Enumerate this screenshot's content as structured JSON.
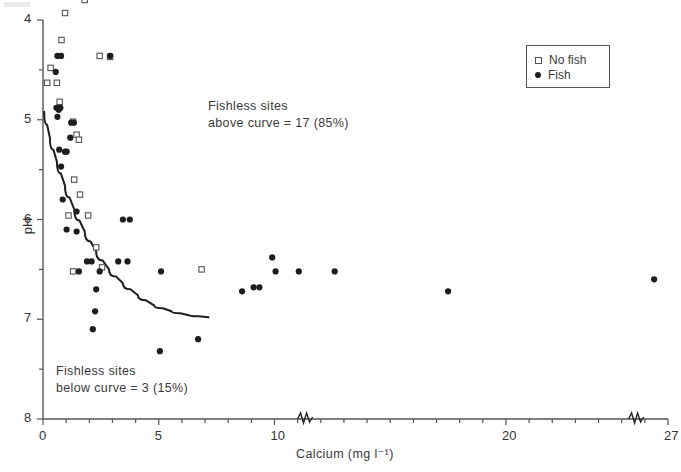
{
  "figure": {
    "ylabel": "pH",
    "xlabel": "Calcium (mg l⁻¹)",
    "annotation_above": "Fishless sites\nabove curve = 17 (85%)",
    "annotation_below": "Fishless sites\nbelow curve = 3 (15%)",
    "legend": {
      "no_fish": "No fish",
      "fish": "Fish"
    }
  },
  "chart_data": {
    "type": "scatter",
    "title": "",
    "xlabel": "Calcium (mg l⁻¹)",
    "ylabel": "pH",
    "xlim": [
      0,
      27
    ],
    "ylim": [
      8,
      4
    ],
    "y_inverted": true,
    "grid": false,
    "legend_position": "top-right",
    "xticks": [
      0,
      5,
      10,
      20,
      27
    ],
    "xtick_labels": [
      "0",
      "5",
      "10",
      "20",
      "27"
    ],
    "xminor_step": 1,
    "yticks": [
      4,
      5,
      6,
      7,
      8
    ],
    "ytick_labels": [
      "4",
      "5",
      "6",
      "7",
      "8"
    ],
    "yminor_step": 0.5,
    "axis_breaks": [
      11.3,
      25.6
    ],
    "series": [
      {
        "name": "No fish",
        "marker": "open-square",
        "color": "#555555",
        "points": [
          [
            1.8,
            3.8
          ],
          [
            0.95,
            3.93
          ],
          [
            0.8,
            4.2
          ],
          [
            2.45,
            4.36
          ],
          [
            0.33,
            4.48
          ],
          [
            0.18,
            4.63
          ],
          [
            0.6,
            4.63
          ],
          [
            2.9,
            4.37
          ],
          [
            0.72,
            4.82
          ],
          [
            1.3,
            5.02
          ],
          [
            1.45,
            5.15
          ],
          [
            1.55,
            5.2
          ],
          [
            1.35,
            5.6
          ],
          [
            1.6,
            5.75
          ],
          [
            1.1,
            5.96
          ],
          [
            1.95,
            5.96
          ],
          [
            2.3,
            6.28
          ],
          [
            2.55,
            6.48
          ],
          [
            1.3,
            6.52
          ],
          [
            6.85,
            6.5
          ]
        ]
      },
      {
        "name": "Fish",
        "marker": "filled-circle",
        "color": "#1d1d1d",
        "points": [
          [
            0.62,
            4.36
          ],
          [
            0.78,
            4.36
          ],
          [
            2.9,
            4.36
          ],
          [
            0.55,
            4.52
          ],
          [
            0.58,
            4.88
          ],
          [
            0.68,
            4.9
          ],
          [
            0.75,
            4.88
          ],
          [
            0.62,
            4.97
          ],
          [
            1.22,
            5.03
          ],
          [
            1.33,
            5.03
          ],
          [
            1.18,
            5.18
          ],
          [
            0.7,
            5.3
          ],
          [
            0.95,
            5.32
          ],
          [
            1.02,
            5.32
          ],
          [
            0.78,
            5.47
          ],
          [
            0.85,
            5.8
          ],
          [
            1.45,
            5.92
          ],
          [
            1.02,
            6.1
          ],
          [
            1.45,
            6.12
          ],
          [
            1.9,
            6.42
          ],
          [
            2.1,
            6.42
          ],
          [
            3.45,
            6.0
          ],
          [
            3.75,
            6.0
          ],
          [
            1.55,
            6.52
          ],
          [
            2.45,
            6.52
          ],
          [
            2.3,
            6.7
          ],
          [
            5.1,
            6.52
          ],
          [
            3.25,
            6.42
          ],
          [
            3.65,
            6.42
          ],
          [
            2.25,
            6.92
          ],
          [
            2.15,
            7.1
          ],
          [
            10.05,
            6.52
          ],
          [
            11.05,
            6.52
          ],
          [
            12.6,
            6.52
          ],
          [
            9.9,
            6.38
          ],
          [
            9.1,
            6.68
          ],
          [
            9.35,
            6.68
          ],
          [
            8.6,
            6.72
          ],
          [
            17.5,
            6.72
          ],
          [
            26.4,
            6.6
          ],
          [
            5.05,
            7.32
          ],
          [
            6.7,
            7.2
          ]
        ]
      }
    ],
    "fitted_curve": {
      "label": "threshold curve",
      "points": [
        [
          0.05,
          4.92
        ],
        [
          0.3,
          5.18
        ],
        [
          0.6,
          5.42
        ],
        [
          0.95,
          5.66
        ],
        [
          1.35,
          5.9
        ],
        [
          1.8,
          6.12
        ],
        [
          2.3,
          6.32
        ],
        [
          2.85,
          6.5
        ],
        [
          3.45,
          6.64
        ],
        [
          4.1,
          6.76
        ],
        [
          4.8,
          6.86
        ],
        [
          5.55,
          6.92
        ],
        [
          6.3,
          6.96
        ],
        [
          7.15,
          6.98
        ]
      ]
    }
  }
}
